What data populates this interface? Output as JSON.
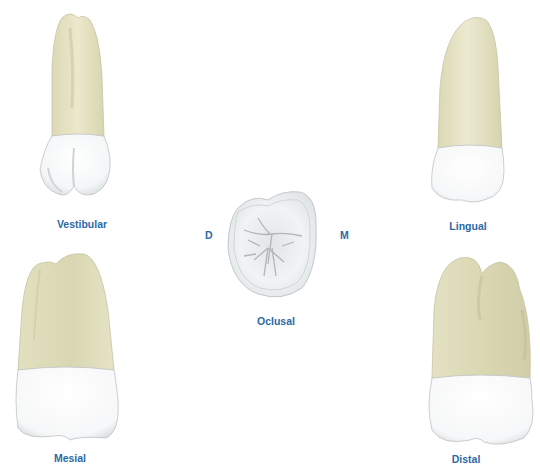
{
  "figure": {
    "colors": {
      "label": "#2b6aa6",
      "root_fill": "#e7e4c6",
      "root_shade": "#cfcca7",
      "crown_fill": "#fbfcfc",
      "crown_shade": "#d9dcde",
      "outline": "#b9bcb8"
    },
    "views": [
      {
        "id": "vestibular",
        "label": "Vestibular"
      },
      {
        "id": "lingual",
        "label": "Lingual"
      },
      {
        "id": "oclusal",
        "label": "Oclusal"
      },
      {
        "id": "mesial",
        "label": "Mesial"
      },
      {
        "id": "distal",
        "label": "Distal"
      }
    ],
    "orientation": {
      "left": "D",
      "right": "M"
    }
  }
}
